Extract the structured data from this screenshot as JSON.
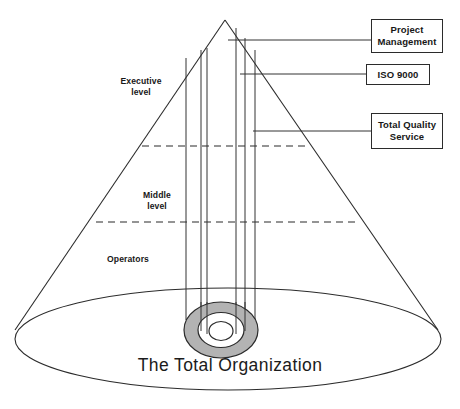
{
  "diagram": {
    "type": "cone-organization-diagram",
    "base_caption": "The Total Organization",
    "cone_levels": [
      {
        "id": "executive",
        "label": "Executive\nlevel"
      },
      {
        "id": "middle",
        "label": "Middle\nlevel"
      },
      {
        "id": "operators",
        "label": "Operators"
      }
    ],
    "callouts": [
      {
        "id": "project-management",
        "label": "Project\nManagement"
      },
      {
        "id": "iso-9000",
        "label": "ISO 9000"
      },
      {
        "id": "total-quality-service",
        "label": "Total Quality\nService"
      }
    ],
    "colors": {
      "stroke": "#2b2b2b",
      "ring_fill": "#b3b3b3",
      "background": "#ffffff"
    },
    "vertical_conduits": 6,
    "divider_lines": 2
  }
}
